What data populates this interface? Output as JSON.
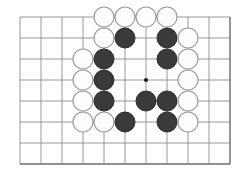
{
  "figure": {
    "kind": "go-board-diagram",
    "caption": "",
    "board": {
      "grid": {
        "columns": 11,
        "rows": 8,
        "spacing_px": 21,
        "origin_x_px": 20,
        "origin_y_px": 17,
        "line_color": "#8c8c8c",
        "edge_line_color": "#6a6a6a",
        "background_color": "#ffffff"
      },
      "star_points": [
        {
          "col": 7,
          "row": 4
        }
      ],
      "stone_radius_px": 10,
      "colors": {
        "black": "#3a3a3a",
        "black_edge": "#2a2a2a",
        "white": "#fdfdfd",
        "white_edge": "#9a9a9a"
      },
      "stones": [
        {
          "color": "white",
          "col": 5,
          "row": 1
        },
        {
          "color": "white",
          "col": 6,
          "row": 1
        },
        {
          "color": "white",
          "col": 7,
          "row": 1
        },
        {
          "color": "white",
          "col": 8,
          "row": 1
        },
        {
          "color": "white",
          "col": 5,
          "row": 2
        },
        {
          "color": "black",
          "col": 6,
          "row": 2
        },
        {
          "color": "black",
          "col": 8,
          "row": 2
        },
        {
          "color": "white",
          "col": 9,
          "row": 2
        },
        {
          "color": "white",
          "col": 4,
          "row": 3
        },
        {
          "color": "black",
          "col": 5,
          "row": 3
        },
        {
          "color": "black",
          "col": 8,
          "row": 3
        },
        {
          "color": "white",
          "col": 9,
          "row": 3
        },
        {
          "color": "white",
          "col": 4,
          "row": 4
        },
        {
          "color": "black",
          "col": 5,
          "row": 4
        },
        {
          "color": "white",
          "col": 9,
          "row": 4
        },
        {
          "color": "white",
          "col": 4,
          "row": 5
        },
        {
          "color": "black",
          "col": 5,
          "row": 5
        },
        {
          "color": "black",
          "col": 7,
          "row": 5
        },
        {
          "color": "black",
          "col": 8,
          "row": 5
        },
        {
          "color": "white",
          "col": 9,
          "row": 5
        },
        {
          "color": "white",
          "col": 4,
          "row": 6
        },
        {
          "color": "white",
          "col": 5,
          "row": 6
        },
        {
          "color": "black",
          "col": 6,
          "row": 6
        },
        {
          "color": "black",
          "col": 8,
          "row": 6
        },
        {
          "color": "white",
          "col": 9,
          "row": 6
        }
      ],
      "counts": {
        "black_stones": 11,
        "white_stones": 14,
        "total_stones": 25
      }
    }
  }
}
